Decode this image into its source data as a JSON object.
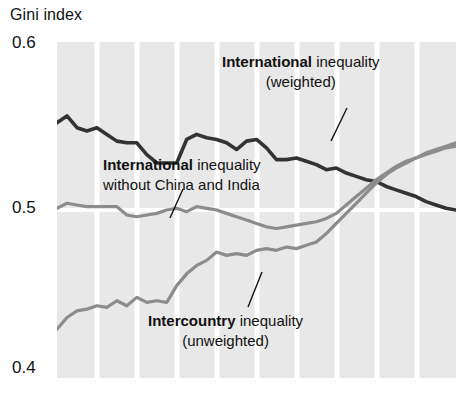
{
  "axis_title": "Gini index",
  "y_ticks": [
    "0.6",
    "0.5",
    "0.4"
  ],
  "annotations": {
    "weighted": {
      "bold": "International",
      "rest": " inequality",
      "line2": "(weighted)"
    },
    "nochina": {
      "bold": "International",
      "rest": " inequality",
      "line2": "without China and India"
    },
    "intercountry": {
      "bold": "Intercountry",
      "rest": " inequality",
      "line2": "(unweighted)"
    }
  },
  "colors": {
    "plot_background": "#e8e8e8",
    "gridline": "#ffffff",
    "series_weighted": "#333333",
    "series_nochina": "#8c8c8c",
    "series_intercountry": "#8c8c8c",
    "text": "#111111"
  },
  "chart_data": {
    "type": "line",
    "title": "",
    "xlabel": "",
    "ylabel": "Gini index",
    "ylim": [
      0.4,
      0.6
    ],
    "xlim": [
      0,
      40
    ],
    "y_tick_values": [
      0.4,
      0.5,
      0.6
    ],
    "grid": "vertical and horizontal white gridlines",
    "legend": "inline annotations with leader lines",
    "x": [
      0,
      1,
      2,
      3,
      4,
      5,
      6,
      7,
      8,
      9,
      10,
      11,
      12,
      13,
      14,
      15,
      16,
      17,
      18,
      19,
      20,
      21,
      22,
      23,
      24,
      25,
      26,
      27,
      28,
      29,
      30,
      31,
      32,
      33,
      34,
      35,
      36,
      37,
      38,
      39,
      40
    ],
    "series": [
      {
        "name": "International inequality (weighted)",
        "color": "#333333",
        "values": [
          0.552,
          0.556,
          0.549,
          0.547,
          0.549,
          0.545,
          0.541,
          0.54,
          0.54,
          0.533,
          0.528,
          0.528,
          0.528,
          0.542,
          0.545,
          0.543,
          0.542,
          0.54,
          0.536,
          0.541,
          0.542,
          0.537,
          0.53,
          0.53,
          0.531,
          0.529,
          0.527,
          0.524,
          0.525,
          0.522,
          0.52,
          0.518,
          0.517,
          0.514,
          0.512,
          0.51,
          0.508,
          0.505,
          0.503,
          0.501,
          0.5
        ]
      },
      {
        "name": "International inequality without China and India",
        "color": "#8c8c8c",
        "values": [
          0.501,
          0.504,
          0.503,
          0.502,
          0.502,
          0.502,
          0.502,
          0.497,
          0.496,
          0.497,
          0.498,
          0.5,
          0.501,
          0.499,
          0.502,
          0.501,
          0.5,
          0.498,
          0.496,
          0.494,
          0.492,
          0.49,
          0.489,
          0.49,
          0.491,
          0.492,
          0.493,
          0.495,
          0.498,
          0.503,
          0.508,
          0.513,
          0.518,
          0.522,
          0.526,
          0.529,
          0.531,
          0.533,
          0.535,
          0.537,
          0.538
        ]
      },
      {
        "name": "Intercountry inequality (unweighted)",
        "color": "#8c8c8c",
        "values": [
          0.429,
          0.436,
          0.44,
          0.441,
          0.443,
          0.442,
          0.446,
          0.443,
          0.448,
          0.445,
          0.446,
          0.445,
          0.455,
          0.462,
          0.467,
          0.47,
          0.475,
          0.473,
          0.474,
          0.473,
          0.476,
          0.477,
          0.476,
          0.478,
          0.477,
          0.479,
          0.481,
          0.486,
          0.492,
          0.498,
          0.504,
          0.51,
          0.516,
          0.521,
          0.525,
          0.528,
          0.531,
          0.534,
          0.536,
          0.538,
          0.54
        ]
      }
    ]
  }
}
